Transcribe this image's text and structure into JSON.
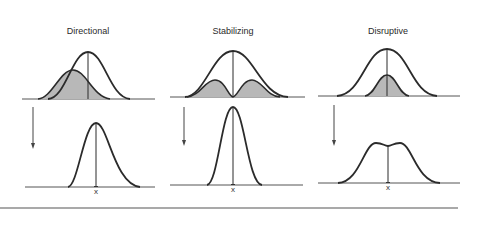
{
  "figure": {
    "panels": [
      {
        "title": "Directional",
        "mean_label": "x",
        "description": "Selection against one extreme shifts the population mean"
      },
      {
        "title": "Stabilizing",
        "mean_label": "x",
        "description": "Selection against both extremes narrows the distribution"
      },
      {
        "title": "Disruptive",
        "mean_label": "x",
        "description": "Selection against intermediates produces a bimodal distribution"
      }
    ]
  },
  "colors": {
    "curve": "#2b2b2b",
    "shade": "#b8b8b8",
    "baseline": "#555555",
    "background": "#ffffff"
  }
}
